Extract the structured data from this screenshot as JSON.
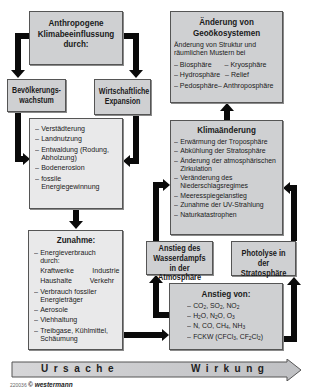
{
  "diagram": {
    "title_box": {
      "lines": [
        "Anthropogene",
        "Klimabeeinflussung",
        "durch:"
      ]
    },
    "cause_left": {
      "lines": [
        "Bevölkerungs-",
        "wachstum"
      ]
    },
    "cause_right": {
      "lines": [
        "Wirtschaftliche",
        "Expansion"
      ]
    },
    "effects_list": {
      "items": [
        "Verstädterung",
        "Landnutzung",
        "Entwaldung (Rodung, Abholzung)",
        "Bodenerosion",
        "fossile Energiegewinnung"
      ]
    },
    "zunahme": {
      "title": "Zunahme:",
      "items": [
        {
          "type": "dash",
          "text": "Energieverbrauch durch:"
        },
        {
          "type": "pair",
          "left": "Kraftwerke",
          "right": "Industrie"
        },
        {
          "type": "pair",
          "left": "Haushalte",
          "right": "Verkehr"
        },
        {
          "type": "dash",
          "text": "Verbrauch fossiler Energieträger"
        },
        {
          "type": "dash",
          "text": "Aerosole"
        },
        {
          "type": "dash",
          "text": "Viehhaltung"
        },
        {
          "type": "dash",
          "text": "Treibgase, Kühlmittel, Schäumung"
        }
      ]
    },
    "geo": {
      "title_lines": [
        "Änderung von",
        "Geoökosystemen"
      ],
      "intro": "Änderung von Struktur und räumlichen Mustern bei",
      "pairs": [
        [
          "Biosphäre",
          "Kryosphäre"
        ],
        [
          "Hydrosphäre",
          "Relief"
        ],
        [
          "Pedosphäre",
          "Anthroposphäre"
        ]
      ]
    },
    "klima": {
      "title": "Klimaänderung",
      "items": [
        "Erwärmung der Troposphäre",
        "Abkühlung der Stratosphäre",
        "Änderung der atmosphärischen Zirkulation",
        "Veränderung des Niederschlagsregimes",
        "Meeresspiegelanstieg",
        "Zunahme der UV-Strahlung",
        "Naturkatastrophen"
      ]
    },
    "wasserdampf": {
      "lines": [
        "Anstieg des",
        "Wasserdampfs",
        "in der Atmosphäre"
      ]
    },
    "photolyse": {
      "lines": [
        "Photolyse in der",
        "Stratosphäre"
      ]
    },
    "anstieg": {
      "title": "Anstieg von:",
      "items": [
        "CO₂, SO₂, NO₂",
        "H₂O, N₂O, O₃",
        "N, CO, CH₄, NH₃",
        "FCKW (CFCl₃, CF₂Cl₂)"
      ]
    },
    "timeline": {
      "cause_label": "Ursache",
      "effect_label": "Wirkung"
    },
    "credit": {
      "code": "220036",
      "publisher": "© westermann"
    },
    "colors": {
      "box_light": "#e9e9ea",
      "box_dark": "#cfd0d2",
      "arrow": "#0a0a0a",
      "border": "#555555"
    }
  }
}
